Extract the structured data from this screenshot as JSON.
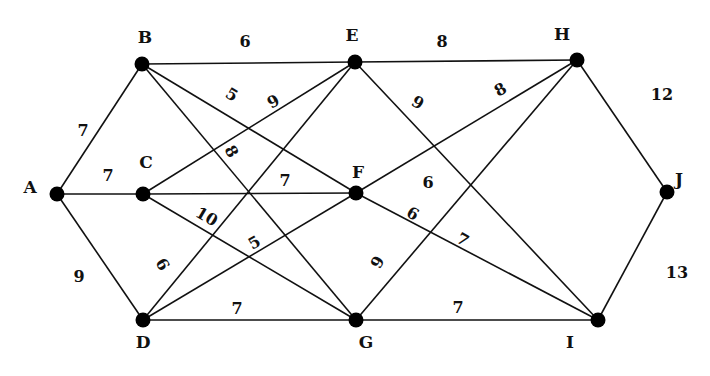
{
  "diagram": {
    "type": "weighted-undirected-graph",
    "nodes": [
      {
        "id": "A",
        "x": 57,
        "y": 194,
        "lx": 30,
        "ly": 193
      },
      {
        "id": "B",
        "x": 142,
        "y": 64,
        "lx": 145,
        "ly": 43
      },
      {
        "id": "C",
        "x": 143,
        "y": 194,
        "lx": 146,
        "ly": 168
      },
      {
        "id": "D",
        "x": 143,
        "y": 320,
        "lx": 143,
        "ly": 348
      },
      {
        "id": "E",
        "x": 355,
        "y": 62,
        "lx": 352,
        "ly": 41
      },
      {
        "id": "F",
        "x": 356,
        "y": 193,
        "lx": 358,
        "ly": 178
      },
      {
        "id": "G",
        "x": 356,
        "y": 320,
        "lx": 366,
        "ly": 348
      },
      {
        "id": "H",
        "x": 577,
        "y": 60,
        "lx": 562,
        "ly": 40
      },
      {
        "id": "I",
        "x": 598,
        "y": 320,
        "lx": 570,
        "ly": 348
      },
      {
        "id": "J",
        "x": 667,
        "y": 192,
        "lx": 679,
        "ly": 185
      }
    ],
    "edges": [
      {
        "from": "A",
        "to": "B",
        "weight": "7"
      },
      {
        "from": "A",
        "to": "C",
        "weight": "7"
      },
      {
        "from": "A",
        "to": "D",
        "weight": "9"
      },
      {
        "from": "B",
        "to": "E",
        "weight": "6"
      },
      {
        "from": "B",
        "to": "F",
        "weight": "5"
      },
      {
        "from": "B",
        "to": "G",
        "weight": "8"
      },
      {
        "from": "C",
        "to": "E",
        "weight": "9"
      },
      {
        "from": "C",
        "to": "F",
        "weight": "7"
      },
      {
        "from": "C",
        "to": "G",
        "weight": "10"
      },
      {
        "from": "D",
        "to": "E",
        "weight": "6"
      },
      {
        "from": "D",
        "to": "F",
        "weight": "5"
      },
      {
        "from": "D",
        "to": "G",
        "weight": "7"
      },
      {
        "from": "E",
        "to": "H",
        "weight": "8"
      },
      {
        "from": "E",
        "to": "I",
        "weight": "9"
      },
      {
        "from": "F",
        "to": "H",
        "weight": "8"
      },
      {
        "from": "F",
        "to": "I",
        "weight": "6"
      },
      {
        "from": "G",
        "to": "H",
        "weight": "9"
      },
      {
        "from": "G",
        "to": "I",
        "weight": "7"
      },
      {
        "from": "H",
        "to": "J",
        "weight": "12"
      },
      {
        "from": "I",
        "to": "J",
        "weight": "13"
      }
    ],
    "weight_labels": [
      {
        "text": "7",
        "x": 83,
        "y": 136,
        "rot": 0
      },
      {
        "text": "6",
        "x": 245,
        "y": 47,
        "rot": 0
      },
      {
        "text": "8",
        "x": 442,
        "y": 47,
        "rot": 0
      },
      {
        "text": "12",
        "x": 662,
        "y": 100,
        "rot": 0
      },
      {
        "text": "5",
        "x": 232,
        "y": 100,
        "rot": 30
      },
      {
        "text": "9",
        "x": 273,
        "y": 107,
        "rot": -30
      },
      {
        "text": "9",
        "x": 418,
        "y": 108,
        "rot": 30
      },
      {
        "text": "8",
        "x": 500,
        "y": 95,
        "rot": -30
      },
      {
        "text": "7",
        "x": 108,
        "y": 181,
        "rot": 0
      },
      {
        "text": "8",
        "x": 232,
        "y": 157,
        "rot": 60
      },
      {
        "text": "7",
        "x": 285,
        "y": 186,
        "rot": 0
      },
      {
        "text": "6",
        "x": 428,
        "y": 188,
        "rot": 0
      },
      {
        "text": "10",
        "x": 207,
        "y": 222,
        "rot": 30
      },
      {
        "text": "6",
        "x": 413,
        "y": 219,
        "rot": 30
      },
      {
        "text": "5",
        "x": 254,
        "y": 248,
        "rot": -30
      },
      {
        "text": "7",
        "x": 463,
        "y": 245,
        "rot": 30
      },
      {
        "text": "6",
        "x": 163,
        "y": 270,
        "rot": 60
      },
      {
        "text": "9",
        "x": 377,
        "y": 268,
        "rot": -60
      },
      {
        "text": "9",
        "x": 79,
        "y": 282,
        "rot": 0
      },
      {
        "text": "13",
        "x": 677,
        "y": 278,
        "rot": 0
      },
      {
        "text": "7",
        "x": 237,
        "y": 314,
        "rot": 0
      },
      {
        "text": "7",
        "x": 458,
        "y": 313,
        "rot": 0
      }
    ]
  }
}
